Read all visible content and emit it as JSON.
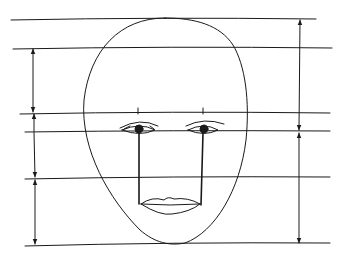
{
  "diagram": {
    "title": "",
    "stroke_color": "#1a1a1a",
    "background": "#ffffff",
    "guide_lines_y": [
      19,
      47,
      113,
      131,
      178,
      244
    ],
    "left_measure_segments": [
      [
        48,
        113
      ],
      [
        131,
        178
      ],
      [
        178,
        244
      ]
    ],
    "right_measure_segments": [
      [
        19,
        131
      ],
      [
        131,
        244
      ]
    ]
  }
}
